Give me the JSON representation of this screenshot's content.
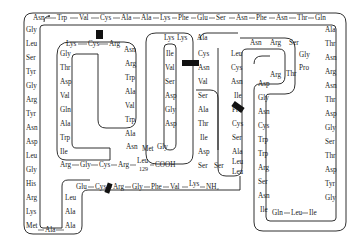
{
  "diagram": {
    "title": "",
    "colors": {
      "line": "#1a1a1a",
      "disulfide": "#111111",
      "background": "#ffffff"
    },
    "n_terminus": {
      "label": "Lys",
      "group": "NH2",
      "text": "—NH₂"
    },
    "c_terminus": {
      "label": "Leu",
      "number": "129",
      "group": "COOH",
      "text": "COOH"
    },
    "chains": {
      "bottom_start": [
        "Glu",
        "Cys",
        "Arg",
        "Gly",
        "Phe",
        "Val",
        "Lys"
      ],
      "left_inner_up": [
        "Leu",
        "Ala",
        "Ala"
      ],
      "bottom_left": [
        "Met",
        "Ala"
      ],
      "outer_left": [
        "Gly",
        "Leu",
        "Ser",
        "Tyr",
        "Gly",
        "Arg",
        "Tyr",
        "Asn",
        "Asp",
        "Leu",
        "Gly",
        "His",
        "Arg",
        "Lys",
        "Met"
      ],
      "top": [
        "Asn",
        "Trp",
        "Val",
        "Cys",
        "Ala",
        "Ala",
        "Lys",
        "Phe",
        "Glu",
        "Ser",
        "Asn",
        "Phe",
        "Asn",
        "Thr",
        "Gln"
      ],
      "outer_right": [
        "Ala",
        "Thr",
        "Asn",
        "Arg",
        "Asn",
        "Thr",
        "Asp",
        "Gly",
        "Ser",
        "Thr",
        "Asp",
        "Tyr",
        "Gly"
      ],
      "bottom_right": [
        "Ile",
        "Leu",
        "Gln",
        "Ile"
      ],
      "inner_right_up": [
        "Ile",
        "Asn",
        "Ser",
        "Arg",
        "Trp",
        "Trp",
        "Cys",
        "Asn",
        "Gly",
        "Asp"
      ],
      "arg_thr": [
        "Arg",
        "Thr"
      ],
      "right_loop_down": [
        "Pro",
        "Gly",
        "Ser",
        "Arg",
        "Asn",
        "Leu"
      ],
      "right_loop_col": [
        "Cys",
        "Asn",
        "Ile",
        "Pro",
        "Cys",
        "Ser",
        "Ala",
        "Leu",
        "Leu"
      ],
      "mid_bottom": [
        "Ser",
        "Ser"
      ],
      "mid_loop_left": [
        "Asp",
        "Ile",
        "Thr",
        "Ala",
        "Ser",
        "Val",
        "Asn",
        "Cys",
        "Ala"
      ],
      "mid_top": [
        "Lys",
        "Lys"
      ],
      "mid_loop_right": [
        "Ile",
        "Val",
        "Ser",
        "Asp",
        "Gly",
        "Asp"
      ],
      "inner_left_bottom": [
        "Asn",
        "Met",
        "Gly"
      ],
      "inner_left_right_col": [
        "Ala",
        "Trp",
        "Val",
        "Ala",
        "Trp",
        "Arg",
        "Asn"
      ],
      "inner_top": [
        "Arg",
        "Cys",
        "Lys"
      ],
      "inner_left_col": [
        "Gly",
        "Thr",
        "Asp",
        "Val",
        "Gln",
        "Ala",
        "Trp",
        "Ile",
        "Arg"
      ],
      "final": [
        "Gly",
        "Cys",
        "Arg",
        "Leu"
      ]
    },
    "labels": {
      "top_row": [
        "Asn",
        "Trp",
        "Val",
        "Cys",
        "Ala",
        "Ala",
        "Lys",
        "Phe",
        "Glu",
        "Ser",
        "Asn",
        "Phe",
        "Asn",
        "Thr",
        "Gln"
      ],
      "left_col": [
        "Gly",
        "Leu",
        "Ser",
        "Tyr",
        "Gly",
        "Arg",
        "Tyr",
        "Asn",
        "Asp",
        "Leu",
        "Gly",
        "His",
        "Arg",
        "Lys"
      ],
      "met": "Met",
      "ala_bottom": "Ala",
      "left_inner": [
        "Leu",
        "Ala",
        "Ala"
      ],
      "bottom_chain": [
        "Glu",
        "Cys",
        "Arg",
        "Gly",
        "Phe",
        "Val"
      ],
      "lys_nterm": "Lys",
      "nh2": "NH₂",
      "inner_top": [
        "Lys",
        "Cys",
        "Arg"
      ],
      "inner_left": [
        "Gly",
        "Thr",
        "Asp",
        "Val",
        "Gln",
        "Ala",
        "Trp",
        "Ile"
      ],
      "inner_bottom": [
        "Arg",
        "Gly",
        "Cys",
        "Arg"
      ],
      "leu129": "Leu",
      "num129": "129",
      "cooh": "COOH",
      "inner_right": [
        "Asn",
        "Arg",
        "Trp",
        "Ala",
        "Val",
        "Trp",
        "Ala"
      ],
      "asn_met_gly": [
        "Asn",
        "Met",
        "Gly"
      ],
      "loop2_top": [
        "Lys",
        "Lys",
        "Ala"
      ],
      "loop2_left": [
        "Ile",
        "Val",
        "Ser",
        "Asp",
        "Gly",
        "Asp"
      ],
      "loop2_right": [
        "Cys",
        "Asn",
        "Val",
        "Ser",
        "Ala",
        "Thr",
        "Ile",
        "Asp"
      ],
      "ser_ser": [
        "Ser",
        "Ser"
      ],
      "loop3_left": [
        "Leu",
        "Cys",
        "Asn",
        "Ile",
        "Pro",
        "Cys",
        "Ser",
        "Ala",
        "Leu",
        "Leu"
      ],
      "loop3_top": [
        "Asn",
        "Arg",
        "Ser"
      ],
      "gly_pro": [
        "Gly",
        "Pro"
      ],
      "arg_thr": [
        "Arg",
        "Thr"
      ],
      "loop4_col": [
        "Asp",
        "Gly",
        "Asn",
        "Cys",
        "Trp",
        "Trp",
        "Arg",
        "Ser",
        "Asn",
        "Ile"
      ],
      "bottom_right": [
        "Gln",
        "Leu",
        "Ile"
      ],
      "right_col": [
        "Ala",
        "Thr",
        "Asn",
        "Arg",
        "Asn",
        "Thr",
        "Asp",
        "Gly",
        "Ser",
        "Thr",
        "Asp",
        "Tyr",
        "Gly"
      ]
    }
  }
}
